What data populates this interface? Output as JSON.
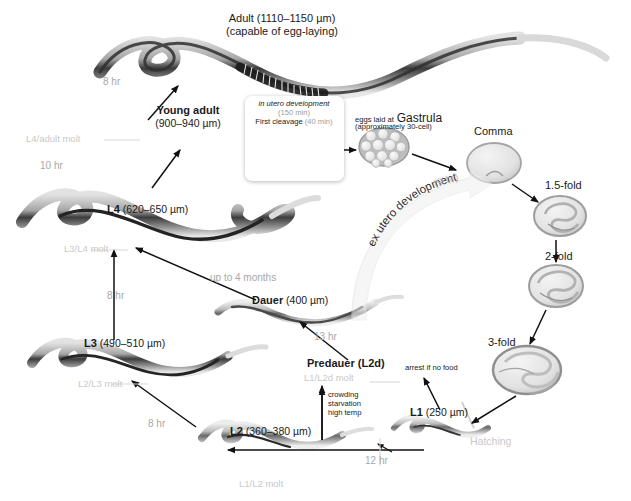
{
  "figure": {
    "bottom_caption": ""
  },
  "stages": {
    "adult_name": "Adult (1110–1150 µm)",
    "adult_note": "(capable of egg-laying)",
    "young_adult_name": "Young adult",
    "young_adult_size": "(900–940 µm)",
    "l4_name": "L4",
    "l4_size": "(620–650 µm)",
    "l3_name": "L3",
    "l3_size": "(490–510 µm)",
    "l2_name": "L2",
    "l2_size": "(360–380 µm)",
    "l1_name": "L1",
    "l1_size": "(250 µm)",
    "dauer_name": "Dauer",
    "dauer_size": "(400 µm)",
    "predauer_name": "Predauer (L2d)"
  },
  "molts": {
    "l4_adult": "L4/adult molt",
    "l3_l4": "L3/L4 molt",
    "l2_l3": "L2/L3 molt",
    "l1_l2": "L1/L2 molt",
    "l1_l2d": "L1/L2d molt",
    "hatching": "Hatching"
  },
  "durations": {
    "adult_from_young": "8 hr",
    "young_from_l4": "10 hr",
    "l4_from_l3": "8 hr",
    "l3_from_l2": "8 hr",
    "l2_from_l1": "12 hr",
    "dauer_from_predauer": "13 hr",
    "dauer_to_l4": "up to 4 months",
    "ex_utero": "ex utero development",
    "ex_utero_time": "(9 hr)"
  },
  "embryo": {
    "in_utero_title": "in utero development",
    "in_utero_time": "(150 min)",
    "first_cleavage": "First cleavage",
    "first_cleavage_time": "(40 min)",
    "gastrula_pre": "eggs laid at",
    "gastrula_name": "Gastrula",
    "gastrula_note": "(approximately 30-cell)",
    "comma": "Comma",
    "fold15": "1.5-fold",
    "fold2": "2-fold",
    "fold3": "3-fold"
  },
  "conditions": {
    "dauer_triggers_line1": "crowding",
    "dauer_triggers_line2": "starvation",
    "dauer_triggers_line3": "high temp",
    "l1_arrest": "arrest if no food"
  },
  "colors": {
    "text": "#1a1a1a",
    "molt_gray": "#c9c9c9",
    "duration_gray": "#a8a8a8",
    "worm_dark": "#2b2b2b",
    "worm_light": "#d8d8d8",
    "embryo_fill": "#e9e9e9",
    "embryo_stroke": "#9a9a9a",
    "background": "#ffffff"
  }
}
